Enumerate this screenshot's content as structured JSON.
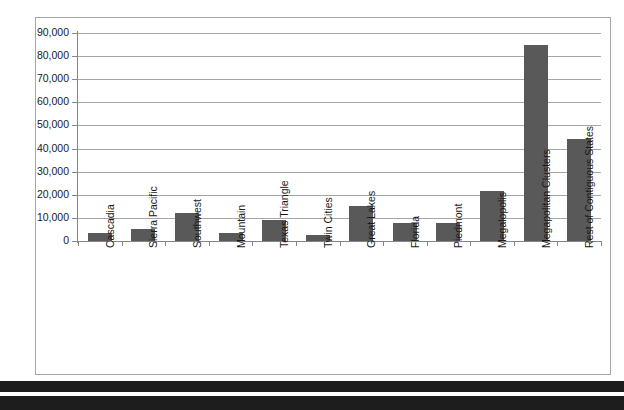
{
  "chart_data": {
    "type": "bar",
    "title": "",
    "xlabel": "",
    "ylabel": "",
    "ylim": [
      0,
      90000
    ],
    "ytick_step": 10000,
    "grid": true,
    "legend": false,
    "bar_color": "#595959",
    "axis_color": "#868686",
    "gridline_color": "#a6a6a6",
    "ytick_labels": [
      "90,000",
      "80,000",
      "70,000",
      "60,000",
      "50,000",
      "40,000",
      "30,000",
      "20,000",
      "10,000",
      "0"
    ],
    "categories": [
      "Cascadia",
      "Sierra Pacific",
      "Southwest",
      "Mountain",
      "Texas Triangle",
      "Twin Cities",
      "Great Lakes",
      "Florida",
      "Piedmont",
      "Megalopolis",
      "Megapolitan Clusters",
      "Rest of Contiguous States"
    ],
    "values": [
      3600,
      5200,
      12300,
      3400,
      9300,
      2400,
      15000,
      7600,
      8000,
      21800,
      85000,
      44000
    ]
  },
  "footer": {
    "caption": ""
  }
}
